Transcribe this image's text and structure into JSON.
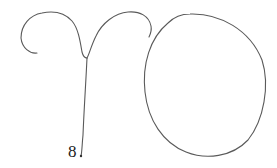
{
  "drawing": {
    "description": "Hand-drawn sketch of a stemmed double-arch figure beside a large circle",
    "label": "8",
    "stroke_color": "#555555"
  }
}
